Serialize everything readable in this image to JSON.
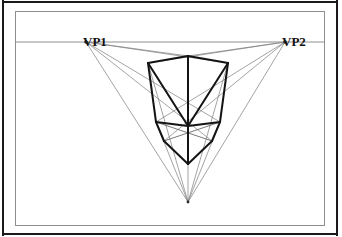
{
  "figure": {
    "type": "line-drawing",
    "labels": {
      "vp1": "VP1",
      "vp2": "VP2"
    },
    "colors": {
      "page_background": "#ffffff",
      "outer_border": "#1a1a1a",
      "figure_frame": "#8d8d8d",
      "horizon_line": "#8f8f8f",
      "construction_line": "#7a7a7a",
      "box_edge": "#141414",
      "vanishing_point_dot": "#2a2a2a",
      "label_text": "#111111"
    },
    "frame": {
      "outer": {
        "x": 2,
        "y": 1,
        "width": 336,
        "height": 234
      },
      "inner": {
        "x": 15,
        "y": 11,
        "width": 310,
        "height": 215
      }
    },
    "vanishing_points": [
      {
        "name": "VP1",
        "x": 85,
        "y": 41,
        "label_x": 67,
        "label_y": 23
      },
      {
        "name": "VP2",
        "x": 284,
        "y": 41,
        "label_x": 266,
        "label_y": 23
      },
      {
        "name": "VP3",
        "x": 187,
        "y": 201,
        "label_x": null,
        "label_y": null
      }
    ],
    "horizon_line": {
      "x1": 16,
      "y1": 41,
      "x2": 324,
      "y2": 41
    },
    "box_vertices": {
      "top_front": {
        "x": 187,
        "y": 55
      },
      "top_left": {
        "x": 147,
        "y": 62
      },
      "top_right": {
        "x": 227,
        "y": 62
      },
      "mid_front": {
        "x": 187,
        "y": 125
      },
      "mid_left": {
        "x": 155,
        "y": 121
      },
      "mid_right": {
        "x": 219,
        "y": 121
      },
      "bottom_left": {
        "x": 163,
        "y": 140
      },
      "bottom_right": {
        "x": 211,
        "y": 140
      },
      "bottom_front": {
        "x": 187,
        "y": 163
      }
    },
    "box_edges": [
      {
        "from": "top_front",
        "to": "top_left",
        "weight": "heavy"
      },
      {
        "from": "top_front",
        "to": "top_right",
        "weight": "heavy"
      },
      {
        "from": "top_left",
        "to": "mid_left",
        "weight": "heavy"
      },
      {
        "from": "top_right",
        "to": "mid_right",
        "weight": "heavy"
      },
      {
        "from": "top_front",
        "to": "mid_front",
        "weight": "heavy"
      },
      {
        "from": "mid_left",
        "to": "mid_front",
        "weight": "heavy"
      },
      {
        "from": "mid_right",
        "to": "mid_front",
        "weight": "heavy"
      },
      {
        "from": "mid_left",
        "to": "bottom_left",
        "weight": "heavy"
      },
      {
        "from": "mid_right",
        "to": "bottom_right",
        "weight": "heavy"
      },
      {
        "from": "mid_front",
        "to": "bottom_front",
        "weight": "heavy"
      },
      {
        "from": "bottom_left",
        "to": "bottom_front",
        "weight": "heavy"
      },
      {
        "from": "bottom_right",
        "to": "bottom_front",
        "weight": "heavy"
      },
      {
        "from": "top_left",
        "to": "mid_front",
        "weight": "heavy"
      },
      {
        "from": "top_right",
        "to": "mid_front",
        "weight": "heavy"
      },
      {
        "from": "bottom_left",
        "to": "mid_right",
        "weight": "light"
      },
      {
        "from": "bottom_right",
        "to": "mid_left",
        "weight": "light"
      }
    ],
    "construction_rays": {
      "from_vp1": [
        {
          "to_x": 227,
          "to_y": 62
        },
        {
          "to_x": 219,
          "to_y": 121
        },
        {
          "to_x": 211,
          "to_y": 140
        },
        {
          "to_x": 187,
          "to_y": 201
        },
        {
          "to_x": 187,
          "to_y": 55
        }
      ],
      "from_vp2": [
        {
          "to_x": 147,
          "to_y": 62
        },
        {
          "to_x": 155,
          "to_y": 121
        },
        {
          "to_x": 163,
          "to_y": 140
        },
        {
          "to_x": 187,
          "to_y": 201
        },
        {
          "to_x": 187,
          "to_y": 55
        }
      ],
      "from_vp3": [
        {
          "to_x": 147,
          "to_y": 62
        },
        {
          "to_x": 227,
          "to_y": 62
        },
        {
          "to_x": 187,
          "to_y": 55
        },
        {
          "to_x": 155,
          "to_y": 121
        },
        {
          "to_x": 219,
          "to_y": 121
        }
      ]
    }
  }
}
